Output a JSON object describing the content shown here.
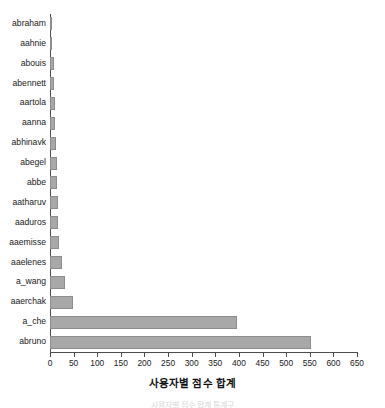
{
  "chart_data": {
    "type": "bar",
    "orientation": "horizontal",
    "title": "",
    "xlabel": "사용자별 점수 합계",
    "ylabel": "",
    "xlim": [
      0,
      650
    ],
    "xticks": [
      0,
      50,
      100,
      150,
      200,
      250,
      300,
      350,
      400,
      450,
      500,
      550,
      600,
      650
    ],
    "xtick_labels": [
      "0",
      "50",
      "100",
      "150",
      "200",
      "250",
      "300",
      "350",
      "400",
      "450",
      "500",
      "550",
      "600",
      "650"
    ],
    "grid": false,
    "legend": false,
    "bar_color": "#a8a8a8",
    "bar_edge_color": "#8d8d8d",
    "categories": [
      "abraham",
      "aahnie",
      "abouis",
      "abennett",
      "aartola",
      "aanna",
      "abhinavk",
      "abegel",
      "abbe",
      "aatharuv",
      "aaduros",
      "aaemisse",
      "aaelenes",
      "a_wang",
      "aaerchak",
      "a_che",
      "abruno"
    ],
    "values": [
      2,
      3,
      8,
      9,
      10,
      11,
      12,
      14,
      15,
      16,
      17,
      19,
      25,
      32,
      48,
      395,
      552
    ]
  },
  "caption": {
    "clipped_text": "사용자별 점수 합계 통계구"
  }
}
